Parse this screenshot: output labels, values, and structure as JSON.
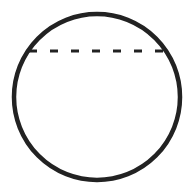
{
  "diagram": {
    "shapes": [
      {
        "type": "circle",
        "name": "outer-circle",
        "cx": 97,
        "cy": 97,
        "r": 83,
        "stroke": "#222222",
        "stroke_width": 4.5,
        "fill": "none"
      },
      {
        "type": "line",
        "name": "dashed-chord",
        "x1": 29,
        "y1": 51,
        "x2": 166,
        "y2": 51,
        "stroke": "#222222",
        "stroke_width": 3,
        "dasharray": "8 13"
      }
    ]
  }
}
